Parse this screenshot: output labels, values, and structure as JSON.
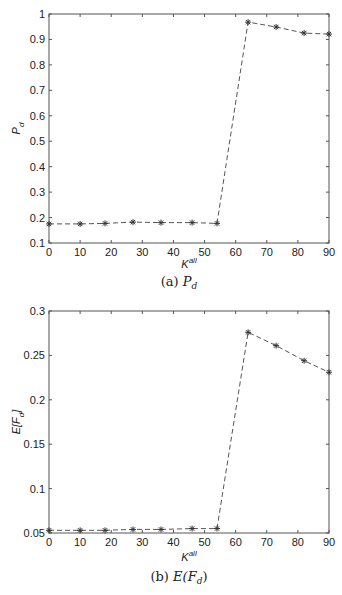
{
  "chart_data": [
    {
      "type": "line",
      "title": "",
      "caption_prefix": "(a)",
      "caption_main": "P",
      "caption_sub": "d",
      "xlabel_main": "K",
      "xlabel_sup": "all",
      "ylabel_main": "P",
      "ylabel_sub": "d",
      "xlim": [
        0,
        90
      ],
      "ylim": [
        0.1,
        1
      ],
      "xticks": [
        "0",
        "10",
        "20",
        "30",
        "40",
        "50",
        "60",
        "70",
        "80",
        "90"
      ],
      "yticks": [
        "0.1",
        "0.2",
        "0.3",
        "0.4",
        "0.5",
        "0.6",
        "0.7",
        "0.8",
        "0.9",
        "1"
      ],
      "grid": false,
      "series": [
        {
          "name": "P_d",
          "style": "dashed-star",
          "x": [
            0,
            10,
            18,
            27,
            36,
            46,
            54,
            64,
            73,
            82,
            90
          ],
          "y": [
            0.175,
            0.175,
            0.177,
            0.182,
            0.18,
            0.18,
            0.177,
            0.968,
            0.949,
            0.925,
            0.921
          ]
        }
      ]
    },
    {
      "type": "line",
      "title": "",
      "caption_prefix": "(b)",
      "caption_main": "E(F",
      "caption_sub": "d",
      "caption_end": ")",
      "xlabel_main": "K",
      "xlabel_sup": "all",
      "ylabel_main": "E[F",
      "ylabel_sub": "d",
      "ylabel_end": "]",
      "xlim": [
        0,
        90
      ],
      "ylim": [
        0.05,
        0.3
      ],
      "xticks": [
        "0",
        "10",
        "20",
        "30",
        "40",
        "50",
        "60",
        "70",
        "80",
        "90"
      ],
      "yticks": [
        "0.05",
        "0.1",
        "0.15",
        "0.2",
        "0.25",
        "0.3"
      ],
      "grid": false,
      "series": [
        {
          "name": "E[F_d]",
          "style": "dashed-star",
          "x": [
            0,
            10,
            18,
            27,
            36,
            46,
            54,
            64,
            73,
            82,
            90
          ],
          "y": [
            0.053,
            0.053,
            0.053,
            0.054,
            0.054,
            0.055,
            0.055,
            0.276,
            0.261,
            0.244,
            0.231
          ]
        }
      ]
    }
  ]
}
